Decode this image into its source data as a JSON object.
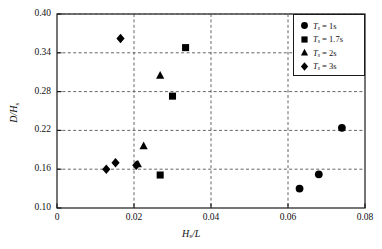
{
  "chart_data": {
    "type": "scatter",
    "title": "",
    "xlabel": "H_s /L",
    "ylabel": "D/H_s",
    "xlim": [
      0,
      0.08
    ],
    "ylim": [
      0.1,
      0.4
    ],
    "xticks": [
      "0",
      "0.02",
      "0.04",
      "0.06",
      "0.08"
    ],
    "xtick_values": [
      0,
      0.02,
      0.04,
      0.06,
      0.08
    ],
    "yticks": [
      "0.10",
      "0.16",
      "0.22",
      "0.28",
      "0.34",
      "0.40"
    ],
    "ytick_values": [
      0.1,
      0.16,
      0.22,
      0.28,
      0.34,
      0.4
    ],
    "grid": "dashed gridlines at x = 0.02, 0.04, 0.06 and y = 0.16, 0.22, 0.28, 0.34, 0.40",
    "legend_position": "top-right",
    "marker_color": "#000000",
    "series": [
      {
        "name": "T_s = 1s",
        "marker": "circle",
        "points": [
          {
            "x": 0.063,
            "y": 0.13
          },
          {
            "x": 0.068,
            "y": 0.152
          },
          {
            "x": 0.074,
            "y": 0.224
          }
        ]
      },
      {
        "name": "T_s = 1.7s",
        "marker": "square",
        "points": [
          {
            "x": 0.0268,
            "y": 0.151
          },
          {
            "x": 0.03,
            "y": 0.273
          },
          {
            "x": 0.0334,
            "y": 0.348
          }
        ]
      },
      {
        "name": "T_s = 2s",
        "marker": "triangle",
        "points": [
          {
            "x": 0.021,
            "y": 0.168
          },
          {
            "x": 0.0225,
            "y": 0.196
          },
          {
            "x": 0.0268,
            "y": 0.305
          }
        ]
      },
      {
        "name": "T_s = 3s",
        "marker": "diamond",
        "points": [
          {
            "x": 0.0128,
            "y": 0.16
          },
          {
            "x": 0.0152,
            "y": 0.17
          },
          {
            "x": 0.0165,
            "y": 0.362
          },
          {
            "x": 0.0206,
            "y": 0.166
          }
        ]
      }
    ]
  },
  "legend": {
    "items": [
      {
        "marker": "circle",
        "label": "= 1s",
        "symbol": "T",
        "sub": "s"
      },
      {
        "marker": "square",
        "label": "= 1.7s",
        "symbol": "T",
        "sub": "s"
      },
      {
        "marker": "triangle",
        "label": "= 2s",
        "symbol": "T",
        "sub": "s"
      },
      {
        "marker": "diamond",
        "label": "= 3s",
        "symbol": "T",
        "sub": "s"
      }
    ]
  },
  "axes": {
    "x_symbol": "H",
    "x_sub": "s",
    "x_rest": "/L",
    "y_symbol": "D/H",
    "y_sub": "s"
  }
}
